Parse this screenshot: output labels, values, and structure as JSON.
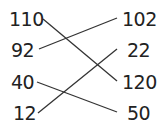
{
  "left": [
    "110",
    "92",
    "40",
    "12"
  ],
  "right": [
    "102",
    "22",
    "120",
    "50"
  ],
  "connections": [
    {
      "from": "110",
      "to": "120"
    },
    {
      "from": "92",
      "to": "102"
    },
    {
      "from": "40",
      "to": "50"
    },
    {
      "from": "12",
      "to": "22"
    }
  ],
  "colors": {
    "line": "#333333",
    "text": "#222222"
  }
}
